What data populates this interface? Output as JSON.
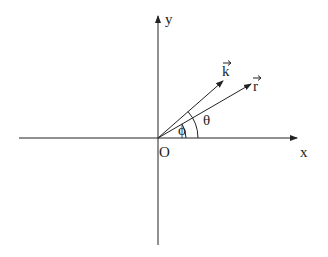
{
  "diagram": {
    "axes": {
      "x_label": "x",
      "y_label": "y",
      "origin_label": "O"
    },
    "vectors": [
      {
        "name": "k",
        "label": "k",
        "has_arrow_accent": true
      },
      {
        "name": "r",
        "label": "r",
        "has_arrow_accent": true
      }
    ],
    "angles": [
      {
        "label": "θ",
        "description": "angle between x-axis and vector k"
      },
      {
        "label": "ϕ",
        "description": "angle between x-axis and vector r"
      }
    ],
    "colors": {
      "stroke": "#222222",
      "background": "#ffffff"
    }
  }
}
